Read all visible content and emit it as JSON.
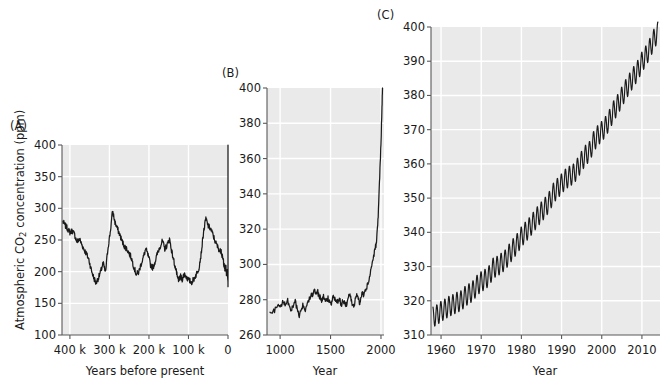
{
  "figure": {
    "background": "#ffffff",
    "plot_background": "#eaeaea",
    "gridline_color": "#ffffff",
    "axis_color": "#595959",
    "line_color": "#1a1a1a",
    "ylabel_main": "Atmospheric CO",
    "ylabel_sub": "2",
    "ylabel_tail": " concentration (ppm)"
  },
  "panels": [
    {
      "id": "A",
      "label": "(A)",
      "xlabel": "Years before present",
      "ylabel": "Atmospheric CO2 concentration (ppm)",
      "yticks": [
        "100",
        "150",
        "200",
        "250",
        "300",
        "350",
        "400"
      ],
      "xticks": [
        "400 k",
        "300 k",
        "200 k",
        "100 k",
        "0"
      ]
    },
    {
      "id": "B",
      "label": "(B)",
      "xlabel": "Year",
      "ylabel": "",
      "yticks": [
        "260",
        "280",
        "300",
        "320",
        "340",
        "360",
        "380",
        "400"
      ],
      "xticks": [
        "1000",
        "1500",
        "2000"
      ]
    },
    {
      "id": "C",
      "label": "(C)",
      "xlabel": "Year",
      "ylabel": "",
      "yticks": [
        "310",
        "320",
        "330",
        "340",
        "350",
        "360",
        "370",
        "380",
        "390",
        "400"
      ],
      "xticks": [
        "1960",
        "1970",
        "1980",
        "1990",
        "2000",
        "2010"
      ]
    }
  ],
  "chart_data": [
    {
      "type": "line",
      "panel": "A",
      "title": "(A)",
      "xlabel": "Years before present",
      "ylabel": "Atmospheric CO2 concentration (ppm)",
      "xlim": [
        420000,
        0
      ],
      "ylim": [
        100,
        400
      ],
      "x_reversed": true,
      "xticks": [
        400000,
        300000,
        200000,
        100000,
        0
      ],
      "xticklabels": [
        "400 k",
        "300 k",
        "200 k",
        "100 k",
        "0"
      ],
      "yticks": [
        100,
        150,
        200,
        250,
        300,
        350,
        400
      ],
      "grid": true,
      "legend": null,
      "description": "Vostok/EPICA ice-core CO2 record showing glacial-interglacial cycles between about 180 and 300 ppm, ending in a near-vertical modern rise to 400 ppm.",
      "series": [
        {
          "name": "Ice core CO2",
          "x": [
            418000,
            412000,
            406000,
            400000,
            394000,
            388000,
            382000,
            376000,
            370000,
            364000,
            358000,
            352000,
            346000,
            340000,
            334000,
            328000,
            322000,
            316000,
            310000,
            304000,
            298000,
            292000,
            286000,
            280000,
            274000,
            268000,
            262000,
            256000,
            250000,
            244000,
            238000,
            232000,
            226000,
            220000,
            214000,
            208000,
            202000,
            196000,
            190000,
            184000,
            178000,
            172000,
            166000,
            160000,
            154000,
            148000,
            142000,
            136000,
            130000,
            128000,
            124000,
            120000,
            116000,
            110000,
            104000,
            98000,
            92000,
            86000,
            80000,
            74000,
            68000,
            62000,
            56000,
            50000,
            44000,
            38000,
            32000,
            26000,
            20000,
            18000,
            15000,
            12000,
            10000,
            8000,
            6000,
            4000,
            2000,
            1000,
            300,
            150,
            60,
            20,
            0
          ],
          "values": [
            279,
            273,
            268,
            262,
            265,
            258,
            247,
            252,
            243,
            235,
            228,
            219,
            203,
            191,
            182,
            190,
            200,
            214,
            198,
            236,
            262,
            296,
            278,
            268,
            259,
            248,
            240,
            236,
            229,
            221,
            207,
            196,
            199,
            212,
            223,
            236,
            225,
            211,
            206,
            217,
            230,
            240,
            248,
            236,
            242,
            252,
            231,
            214,
            198,
            190,
            187,
            192,
            188,
            197,
            190,
            186,
            183,
            189,
            196,
            205,
            228,
            262,
            284,
            272,
            268,
            258,
            247,
            239,
            232,
            236,
            224,
            219,
            210,
            204,
            211,
            198,
            203,
            194,
            188,
            193,
            184,
            178,
            190,
            205,
            240,
            262,
            285,
            340,
            400
          ]
        }
      ]
    },
    {
      "type": "line",
      "panel": "B",
      "title": "(B)",
      "xlabel": "Year",
      "ylabel": "",
      "xlim": [
        870,
        2030
      ],
      "ylim": [
        260,
        400
      ],
      "xticks": [
        1000,
        1500,
        2000
      ],
      "xticklabels": [
        "1000",
        "1500",
        "2000"
      ],
      "yticks": [
        260,
        280,
        300,
        320,
        340,
        360,
        380,
        400
      ],
      "grid": true,
      "legend": null,
      "description": "Last ~1100 years of CO2 from ice cores: a noisy pre-industrial plateau near 275-285 ppm followed by a sharp hockey-stick rise after 1850 to 400 ppm.",
      "series": [
        {
          "name": "CO2 concentration",
          "x": [
            900,
            930,
            960,
            990,
            1010,
            1030,
            1050,
            1070,
            1090,
            1110,
            1130,
            1150,
            1170,
            1190,
            1210,
            1230,
            1250,
            1270,
            1290,
            1310,
            1320,
            1340,
            1355,
            1370,
            1385,
            1400,
            1415,
            1430,
            1445,
            1460,
            1475,
            1490,
            1505,
            1520,
            1535,
            1550,
            1565,
            1580,
            1595,
            1610,
            1625,
            1640,
            1655,
            1670,
            1685,
            1700,
            1715,
            1730,
            1745,
            1760,
            1775,
            1790,
            1800,
            1815,
            1830,
            1845,
            1860,
            1875,
            1890,
            1905,
            1920,
            1935,
            1950,
            1960,
            1970,
            1980,
            1990,
            2000,
            2010,
            2015
          ],
          "values": [
            272,
            273,
            275,
            277,
            276,
            279,
            277,
            280,
            277,
            274,
            276,
            279,
            274,
            271,
            275,
            277,
            274,
            277,
            281,
            284,
            283,
            286,
            283,
            285,
            282,
            281,
            279,
            282,
            280,
            279,
            281,
            279,
            277,
            280,
            282,
            279,
            278,
            281,
            279,
            277,
            280,
            278,
            277,
            280,
            283,
            281,
            278,
            276,
            280,
            283,
            280,
            278,
            282,
            284,
            283,
            285,
            287,
            290,
            294,
            298,
            303,
            307,
            311,
            316,
            325,
            338,
            354,
            369,
            389,
            400
          ]
        }
      ]
    },
    {
      "type": "line",
      "panel": "C",
      "title": "(C)",
      "xlabel": "Year",
      "ylabel": "",
      "xlim": [
        1957.5,
        2014.5
      ],
      "ylim": [
        310,
        400
      ],
      "xticks": [
        1960,
        1970,
        1980,
        1990,
        2000,
        2010
      ],
      "xticklabels": [
        "1960",
        "1970",
        "1980",
        "1990",
        "2000",
        "2010"
      ],
      "yticks": [
        310,
        320,
        330,
        340,
        350,
        360,
        370,
        380,
        390,
        400
      ],
      "grid": true,
      "legend": null,
      "seasonal_amplitude_ppm": 3.0,
      "seasonal_period_years": 1,
      "description": "Mauna Loa Keeling Curve: monthly mean CO2 rising from about 315 ppm in 1958 to about 400 ppm in 2014, with a regular annual sawtooth oscillation of roughly 6 ppm peak-to-trough.",
      "series": [
        {
          "name": "Mauna Loa annual mean CO2",
          "x": [
            1958,
            1959,
            1960,
            1961,
            1962,
            1963,
            1964,
            1965,
            1966,
            1967,
            1968,
            1969,
            1970,
            1971,
            1972,
            1973,
            1974,
            1975,
            1976,
            1977,
            1978,
            1979,
            1980,
            1981,
            1982,
            1983,
            1984,
            1985,
            1986,
            1987,
            1988,
            1989,
            1990,
            1991,
            1992,
            1993,
            1994,
            1995,
            1996,
            1997,
            1998,
            1999,
            2000,
            2001,
            2002,
            2003,
            2004,
            2005,
            2006,
            2007,
            2008,
            2009,
            2010,
            2011,
            2012,
            2013,
            2014
          ],
          "values": [
            315.3,
            315.9,
            316.9,
            317.6,
            318.4,
            318.9,
            319.6,
            320.0,
            321.3,
            322.1,
            323.0,
            324.6,
            325.6,
            326.3,
            327.4,
            329.6,
            330.1,
            331.0,
            332.0,
            333.7,
            335.3,
            336.8,
            338.7,
            340.1,
            341.4,
            343.0,
            344.6,
            346.0,
            347.4,
            349.1,
            351.5,
            352.9,
            354.2,
            355.6,
            356.4,
            357.1,
            358.8,
            360.8,
            362.6,
            363.7,
            366.6,
            368.3,
            369.5,
            371.0,
            373.1,
            375.6,
            377.4,
            379.6,
            381.8,
            383.7,
            385.6,
            387.4,
            389.8,
            391.6,
            393.8,
            396.5,
            398.6
          ]
        }
      ]
    }
  ]
}
